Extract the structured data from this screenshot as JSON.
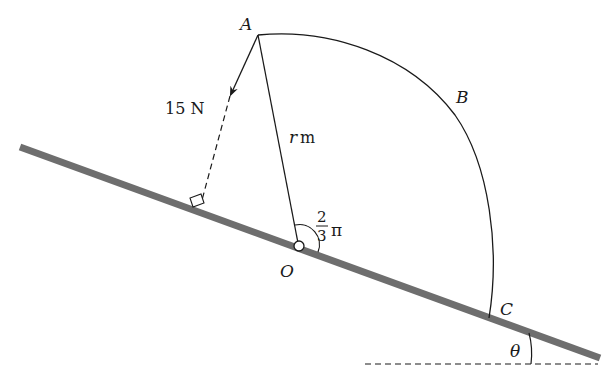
{
  "diagram": {
    "type": "mechanics-rod-on-incline",
    "labels": {
      "point_a": "A",
      "point_b": "B",
      "point_c": "C",
      "point_o": "O",
      "force": "15 N",
      "radius_var": "r",
      "radius_unit": "m",
      "angle_num": "2",
      "angle_den": "3",
      "angle_pi": "π",
      "incline_angle": "θ"
    },
    "colors": {
      "rod": "#6e6e6e",
      "line": "#1a1a1a",
      "background": "#ffffff"
    }
  }
}
